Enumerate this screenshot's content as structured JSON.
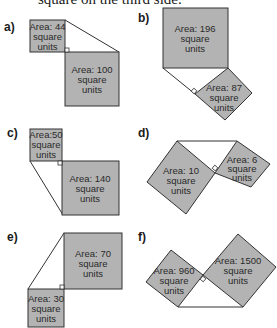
{
  "intro_text": "square on the third side.",
  "unit_line": "square",
  "unit_line2": "units",
  "diagrams": [
    {
      "label": "a)",
      "squares": [
        {
          "area_text": "Area: 44"
        },
        {
          "area_text": "Area: 100"
        }
      ]
    },
    {
      "label": "b)",
      "squares": [
        {
          "area_text": "Area: 196"
        },
        {
          "area_text": "Area: 87"
        }
      ]
    },
    {
      "label": "c)",
      "squares": [
        {
          "area_text": "Area:50"
        },
        {
          "area_text": "Area: 140"
        }
      ]
    },
    {
      "label": "d)",
      "squares": [
        {
          "area_text": "Area: 10"
        },
        {
          "area_text": "Area: 6"
        }
      ]
    },
    {
      "label": "e)",
      "squares": [
        {
          "area_text": "Area: 70"
        },
        {
          "area_text": "Area: 30"
        }
      ]
    },
    {
      "label": "f)",
      "squares": [
        {
          "area_text": "Area: 960"
        },
        {
          "area_text": "Area: 1500"
        }
      ]
    }
  ],
  "colors": {
    "square_fill": "#b3b3b3",
    "stroke": "#333333"
  }
}
